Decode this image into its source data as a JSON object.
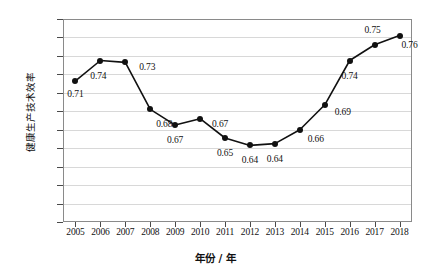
{
  "chart_data": {
    "type": "line",
    "title": "",
    "xlabel": "年份 / 年",
    "ylabel": "健康生产技术效率",
    "categories": [
      "2005",
      "2006",
      "2007",
      "2008",
      "2009",
      "2010",
      "2011",
      "2012",
      "2013",
      "2014",
      "2015",
      "2016",
      "2017",
      "2018"
    ],
    "values": [
      0.71,
      0.74,
      0.73,
      0.68,
      0.67,
      0.67,
      0.65,
      0.64,
      0.64,
      0.66,
      0.69,
      0.74,
      0.75,
      0.76
    ],
    "point_values": [
      0.713,
      0.735,
      0.733,
      0.682,
      0.665,
      0.672,
      0.651,
      0.643,
      0.645,
      0.66,
      0.687,
      0.735,
      0.752,
      0.762
    ],
    "data_labels": [
      "0.71",
      "0.74",
      "0.73",
      "0.68",
      "0.67",
      "0.67",
      "0.65",
      "0.64",
      "0.64",
      "0.66",
      "0.69",
      "0.74",
      "0.75",
      "0.76"
    ],
    "ylim": [
      0.56,
      0.78
    ],
    "ytick_labels": [
      "0.78",
      "0.76",
      "0.74",
      "0.72",
      "0.70",
      "0.68",
      "0.66",
      "0.64",
      "0.62",
      "0.60",
      "0.58",
      "0.56"
    ],
    "ytick_values": [
      0.78,
      0.76,
      0.74,
      0.72,
      0.7,
      0.68,
      0.66,
      0.64,
      0.62,
      0.6,
      0.58,
      0.56
    ],
    "grid": true,
    "legend": "none",
    "series_color": "#111111",
    "grid_color": "#d8d8d8",
    "marker": "filled-circle"
  }
}
